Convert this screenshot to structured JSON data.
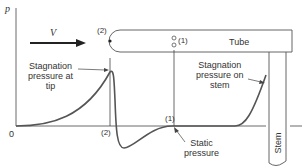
{
  "diagram": {
    "axis": {
      "y_label": "p",
      "origin_label": "0"
    },
    "flow": {
      "velocity_label": "V"
    },
    "tube": {
      "label": "Tube",
      "tip_point": "(2)",
      "static_port": "(1)"
    },
    "stem": {
      "label": "Stem"
    },
    "x_marks": {
      "point2": "(2)",
      "point1": "(1)"
    },
    "annotations": {
      "stagnation_tip": [
        "Stagnation",
        "pressure at",
        "tip"
      ],
      "stagnation_stem": [
        "Stagnation",
        "pressure on",
        "stem"
      ],
      "static": [
        "Static",
        "pressure"
      ]
    },
    "colors": {
      "curve": "#555555",
      "line": "#444444"
    }
  }
}
